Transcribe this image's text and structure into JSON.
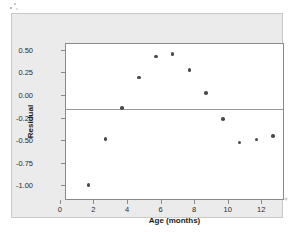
{
  "chart_data": {
    "type": "scatter",
    "title": "",
    "xlabel": "Age (months)",
    "ylabel": "Residual",
    "xlim": [
      -0.35,
      12.7
    ],
    "ylim": [
      -1.02,
      0.72
    ],
    "xticks": [
      0,
      2,
      4,
      6,
      8,
      10,
      12
    ],
    "xtick_labels": [
      "0",
      "2",
      "4",
      "6",
      "8",
      "10",
      "12"
    ],
    "yticks": [
      0.5,
      0.25,
      0.0,
      -0.25,
      -0.5,
      -0.75,
      -1.0
    ],
    "ytick_labels": [
      "0.50",
      "0.25",
      "0.00",
      "-0.25",
      "-0.50",
      "-0.75",
      "-1.00"
    ],
    "grid": false,
    "legend": "none",
    "reference_lines": [
      {
        "axis": "y",
        "value": 0.0
      }
    ],
    "x": [
      1,
      2,
      3,
      4,
      5,
      6,
      7,
      8,
      9,
      10,
      11,
      12
    ],
    "y": [
      -0.84,
      -0.33,
      0.01,
      0.35,
      0.58,
      0.61,
      0.43,
      0.18,
      -0.11,
      -0.37,
      -0.34,
      -0.3
    ],
    "points": [
      {
        "x": 1,
        "y": -0.84
      },
      {
        "x": 2,
        "y": -0.33
      },
      {
        "x": 3,
        "y": 0.01
      },
      {
        "x": 4,
        "y": 0.35
      },
      {
        "x": 5,
        "y": 0.58
      },
      {
        "x": 6,
        "y": 0.61
      },
      {
        "x": 7,
        "y": 0.43
      },
      {
        "x": 8,
        "y": 0.18
      },
      {
        "x": 9,
        "y": -0.11
      },
      {
        "x": 10,
        "y": -0.37
      },
      {
        "x": 11,
        "y": -0.34
      },
      {
        "x": 12,
        "y": -0.3
      }
    ],
    "marker_color": "#4a4a4a",
    "plot_background": "#ffffff",
    "figure_background": "#ebebeb",
    "axis_color": "#8a8a8a"
  }
}
